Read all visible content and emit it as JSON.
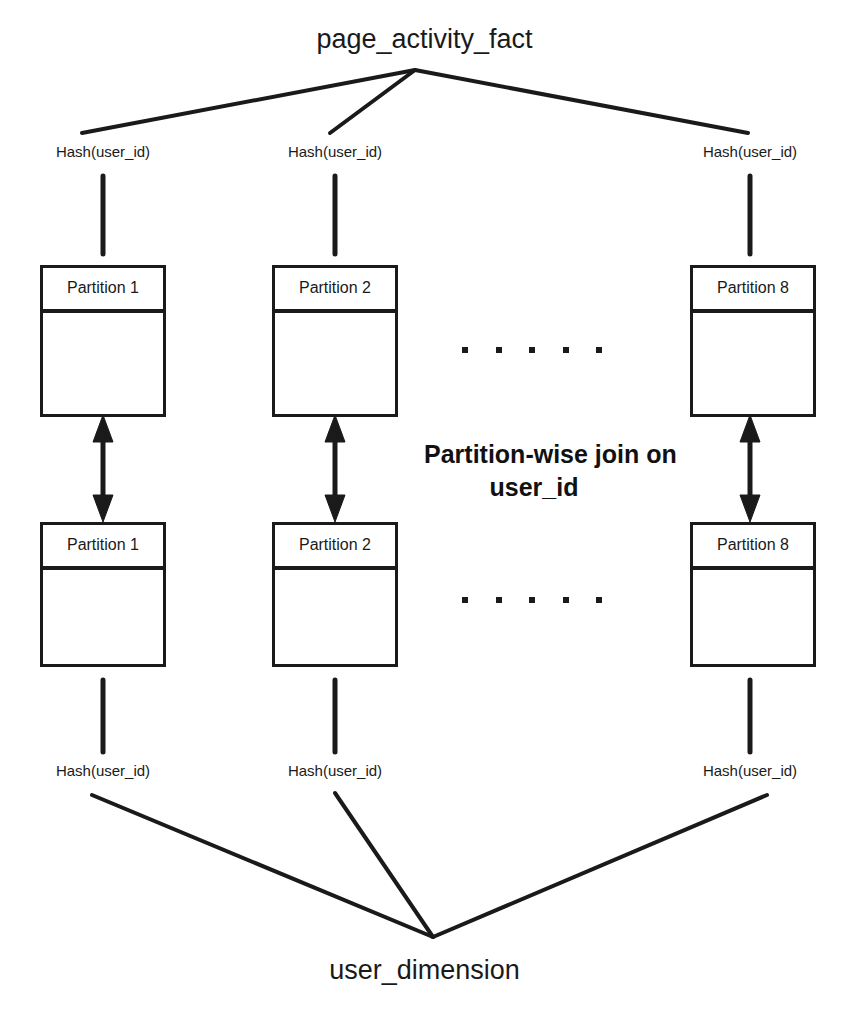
{
  "diagram": {
    "type": "partition-wise-join-diagram",
    "background_color": "#ffffff",
    "line_color": "#1a1a1a",
    "top_node": {
      "label": "page_activity_fact"
    },
    "bottom_node": {
      "label": "user_dimension"
    },
    "center_annotation": {
      "line1": "Partition-wise join on",
      "line2": "user_id"
    },
    "hash_labels_top": [
      {
        "text": "Hash(user_id)"
      },
      {
        "text": "Hash(user_id)"
      },
      {
        "text": "Hash(user_id)"
      }
    ],
    "hash_labels_bottom": [
      {
        "text": "Hash(user_id)"
      },
      {
        "text": "Hash(user_id)"
      },
      {
        "text": "Hash(user_id)"
      }
    ],
    "fact_partitions": [
      {
        "title": "Partition 1"
      },
      {
        "title": "Partition 2"
      },
      {
        "title": "Partition 8"
      }
    ],
    "dim_partitions": [
      {
        "title": "Partition 1"
      },
      {
        "title": "Partition 2"
      },
      {
        "title": "Partition 8"
      }
    ],
    "ellipsis_dot_count": 5
  }
}
